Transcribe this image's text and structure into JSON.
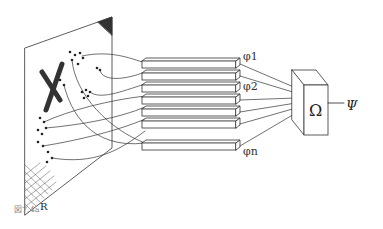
{
  "figure": {
    "caption": "図7.4a",
    "retina_label": "R",
    "pattern_letter": "X",
    "predicate_labels": [
      "φ1",
      "φ2",
      "φn"
    ],
    "decision_unit_symbol": "Ω",
    "output_symbol": "Ψ",
    "predicate_count_drawn": 7
  }
}
